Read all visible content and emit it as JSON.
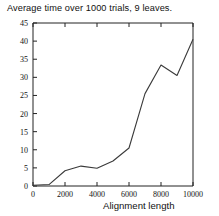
{
  "chart_data": {
    "type": "line",
    "title": "Average time over 1000 trials, 9 leaves.",
    "xlabel": "Alignment length",
    "ylabel": "",
    "xlim": [
      0,
      10000
    ],
    "ylim": [
      0,
      45
    ],
    "grid": false,
    "legend": null,
    "xticks": [
      0,
      2000,
      4000,
      6000,
      8000,
      10000
    ],
    "xtick_labels": [
      "0",
      "2000",
      "4000",
      "6000",
      "8000",
      "10000"
    ],
    "yticks": [
      0,
      5,
      10,
      15,
      20,
      25,
      30,
      35,
      40,
      45
    ],
    "ytick_labels": [
      "0",
      "5",
      "10",
      "15",
      "20",
      "25",
      "30",
      "35",
      "40",
      "45"
    ],
    "x": [
      0,
      1000,
      2000,
      3000,
      4000,
      5000,
      6000,
      7000,
      8000,
      9000,
      10000
    ],
    "values": [
      0.2,
      0.4,
      4.2,
      5.5,
      4.9,
      6.9,
      10.5,
      25.5,
      33.4,
      30.5,
      40.5
    ],
    "series": [
      {
        "name": "average time",
        "values": [
          0.2,
          0.4,
          4.2,
          5.5,
          4.9,
          6.9,
          10.5,
          25.5,
          33.4,
          30.5,
          40.5
        ]
      }
    ],
    "line_color": "#3a3a3a"
  },
  "figure": {
    "background": "#ffffff",
    "axis_color": "#222222"
  }
}
